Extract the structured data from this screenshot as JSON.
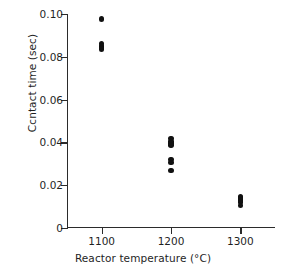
{
  "chart_data": {
    "type": "scatter",
    "title": "",
    "xlabel": "Reactor temperature (°C)",
    "ylabel": "Ccntact time (sec)",
    "xlim": [
      1050,
      1350
    ],
    "ylim": [
      0,
      0.1
    ],
    "grid": false,
    "legend": null,
    "xticks": [
      1100,
      1200,
      1300
    ],
    "xtick_labels": [
      "1100",
      "1200",
      "1300"
    ],
    "yticks": [
      0,
      0.02,
      0.04,
      0.06,
      0.08,
      0.1
    ],
    "ytick_labels": [
      "0",
      "0.02",
      "0.04",
      "0.06",
      "0.08",
      "0.10"
    ],
    "marker": "filled-circle",
    "marker_color": "#111111",
    "series": [
      {
        "name": "contact time",
        "points": [
          {
            "x": 1100,
            "y": 0.0977
          },
          {
            "x": 1100,
            "y": 0.0862
          },
          {
            "x": 1100,
            "y": 0.085
          },
          {
            "x": 1100,
            "y": 0.0843
          },
          {
            "x": 1100,
            "y": 0.0836
          },
          {
            "x": 1200,
            "y": 0.0418
          },
          {
            "x": 1200,
            "y": 0.0405
          },
          {
            "x": 1200,
            "y": 0.0397
          },
          {
            "x": 1200,
            "y": 0.0388
          },
          {
            "x": 1200,
            "y": 0.032
          },
          {
            "x": 1200,
            "y": 0.0305
          },
          {
            "x": 1200,
            "y": 0.0268
          },
          {
            "x": 1300,
            "y": 0.0148
          },
          {
            "x": 1300,
            "y": 0.014
          },
          {
            "x": 1300,
            "y": 0.0131
          },
          {
            "x": 1300,
            "y": 0.0122
          },
          {
            "x": 1300,
            "y": 0.0105
          }
        ]
      }
    ]
  }
}
